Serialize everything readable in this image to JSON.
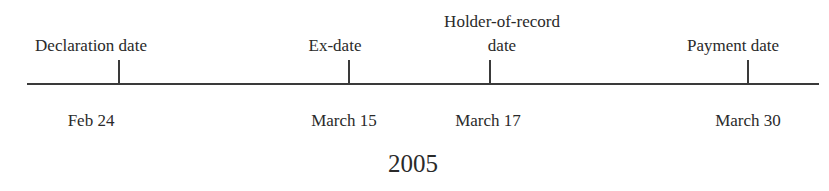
{
  "timeline": {
    "year": "2005",
    "events": [
      {
        "name": "Declaration date",
        "label_lines": [
          "Declaration date"
        ],
        "date": "Feb 24",
        "x": 119
      },
      {
        "name": "Ex-date",
        "label_lines": [
          "Ex-date"
        ],
        "date": "March 15",
        "x": 349
      },
      {
        "name": "Holder-of-record date",
        "label_lines": [
          "Holder-of-record",
          "date"
        ],
        "date": "March 17",
        "x": 490
      },
      {
        "name": "Payment date",
        "label_lines": [
          "Payment date"
        ],
        "date": "March 30",
        "x": 748
      }
    ]
  }
}
